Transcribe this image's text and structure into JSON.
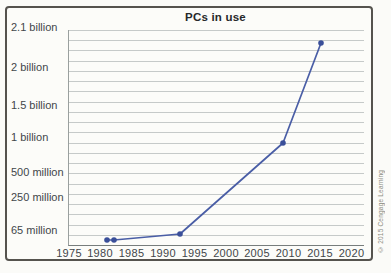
{
  "figure": {
    "copyright": "© 2015 Cengage Learning"
  },
  "chart_data": {
    "type": "line",
    "title": "PCs in use",
    "x_axis": {
      "ticks": [
        "1975",
        "1980",
        "1985",
        "1990",
        "1995",
        "2000",
        "2005",
        "2010",
        "2015",
        "2020"
      ],
      "range": [
        1975,
        2020
      ]
    },
    "y_axis": {
      "labels": [
        "2.1 billion",
        "2 billion",
        "1.5 billion",
        "1 billion",
        "500 million",
        "250 million",
        "65 million"
      ],
      "scale": "nonlinear",
      "grid": true
    },
    "series": [
      {
        "name": "PCs in use",
        "points": [
          {
            "year": 1981,
            "approx_value_millions": 3
          },
          {
            "year": 1982,
            "approx_value_millions": 6
          },
          {
            "year": 1992,
            "approx_value_millions": 65
          },
          {
            "year": 2008,
            "approx_value_millions": 1000
          },
          {
            "year": 2015,
            "approx_value_millions": 2050
          }
        ]
      }
    ],
    "colors": {
      "line": "#4a5ea6",
      "marker": "#3a4f99",
      "grid": "#c6cac9",
      "axis": "#8f9595",
      "text": "#42464a",
      "border": "#55534e"
    },
    "layout": {
      "plot_width": 295,
      "plot_height": 215,
      "gridline_count": 21,
      "y_label_offsets_px": [
        -3,
        37,
        75,
        107,
        142,
        167,
        200
      ],
      "x_tick_offsets_px": [
        1,
        32,
        63.5,
        95,
        126.5,
        158,
        189,
        220.5,
        252,
        283.5
      ],
      "point_offsets_px": [
        [
          38,
          210
        ],
        [
          45,
          210
        ],
        [
          111,
          204
        ],
        [
          214,
          113
        ],
        [
          252,
          13
        ]
      ]
    }
  }
}
